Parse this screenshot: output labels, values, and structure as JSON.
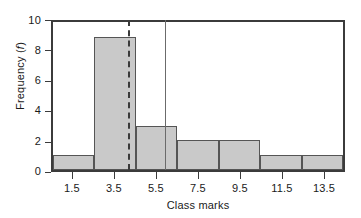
{
  "chart_data": {
    "type": "bar",
    "title": "",
    "subtitle": "",
    "xlabel": "Class marks",
    "ylabel": "Frequency (f)",
    "ylabel_parts": {
      "text": "Frequency (",
      "italic": "f",
      "tail": ")"
    },
    "categories": [
      "1.5",
      "3.5",
      "5.5",
      "7.5",
      "9.5",
      "11.5",
      "13.5"
    ],
    "values": [
      1,
      9,
      3,
      2,
      2,
      1,
      1
    ],
    "xticks": [
      "1.5",
      "3.5",
      "5.5",
      "7.5",
      "9.5",
      "11.5",
      "13.5"
    ],
    "yticks": [
      "0",
      "2",
      "4",
      "6",
      "8",
      "10"
    ],
    "ylim": [
      0,
      10
    ],
    "xlim": [
      0.5,
      14.5
    ],
    "bin_width": 2,
    "grid": false,
    "legend": "none",
    "bar_fill_color": "#c9c9c9",
    "bar_edge_color": "#555555",
    "axis_color": "#3b3b3b",
    "annotations": [
      {
        "name": "median-line",
        "style": "dashed",
        "value": 4.1,
        "color": "#3a3a3a"
      },
      {
        "name": "mean-line",
        "style": "solid",
        "value": 5.9,
        "color": "#6b6b6b"
      }
    ]
  }
}
